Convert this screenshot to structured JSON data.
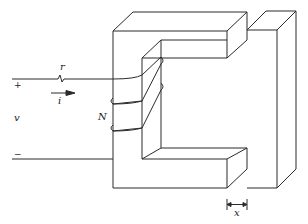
{
  "diagram": {
    "colors": {
      "line": "#2a2a2a",
      "background": "#ffffff"
    },
    "labels": {
      "resistance": "r",
      "current": "i",
      "voltage": "v",
      "turns": "N",
      "gap": "x",
      "plus": "+",
      "minus": "−"
    },
    "components": [
      {
        "id": "source",
        "label": "v",
        "polarity": [
          "+",
          "−"
        ]
      },
      {
        "id": "resistor",
        "label": "r"
      },
      {
        "id": "current-arrow",
        "label": "i"
      },
      {
        "id": "coil",
        "label": "N",
        "turns_drawn": 3
      },
      {
        "id": "c-core",
        "label": ""
      },
      {
        "id": "armature",
        "label": ""
      },
      {
        "id": "air-gap",
        "label": "x"
      }
    ]
  }
}
